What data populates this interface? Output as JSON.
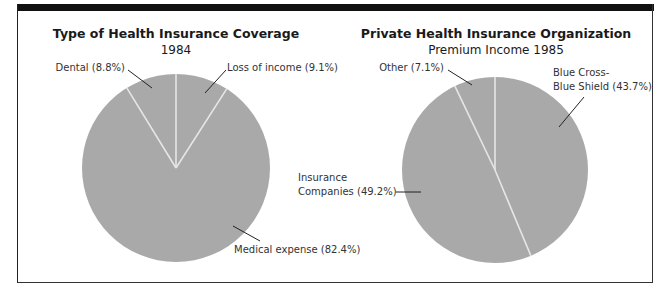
{
  "colors": {
    "slice_fill": "#a9a9a9",
    "slice_divider": "#e6e6e6",
    "frame": "#111111",
    "text": "#1a1a1a"
  },
  "chart_data": [
    {
      "type": "pie",
      "title": "Type of Health Insurance Coverage",
      "subtitle": "1984",
      "categories": [
        "Loss of income",
        "Medical expense",
        "Dental"
      ],
      "values": [
        9.1,
        82.4,
        8.8
      ],
      "labels": [
        "Loss of income (9.1%)",
        "Medical expense (82.4%)",
        "Dental (8.8%)"
      ],
      "start_angle_deg": 0,
      "direction": "clockwise"
    },
    {
      "type": "pie",
      "title": "Private Health Insurance Organization",
      "subtitle": "Premium Income 1985",
      "categories": [
        "Blue Cross-Blue Shield",
        "Insurance Companies",
        "Other"
      ],
      "values": [
        43.7,
        49.2,
        7.1
      ],
      "labels": [
        "Blue Cross-",
        "Blue Shield (43.7%)",
        "Insurance",
        "Companies (49.2%)",
        "Other (7.1%)"
      ],
      "start_angle_deg": 0,
      "direction": "clockwise"
    }
  ],
  "left": {
    "title": "Type of Health Insurance Coverage",
    "subtitle": "1984",
    "label_dental": "Dental (8.8%)",
    "label_loss": "Loss of income (9.1%)",
    "label_medical": "Medical expense (82.4%)"
  },
  "right": {
    "title": "Private Health Insurance Organization",
    "subtitle": "Premium Income 1985",
    "label_other": "Other (7.1%)",
    "label_bcbs_1": "Blue Cross-",
    "label_bcbs_2": "Blue Shield (43.7%)",
    "label_ins_1": "Insurance",
    "label_ins_2": "Companies (49.2%)"
  }
}
